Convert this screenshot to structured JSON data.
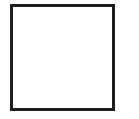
{
  "shape": {
    "type": "square-outline",
    "border_color": "#1e1e1e",
    "fill_color": "#ffffff"
  }
}
